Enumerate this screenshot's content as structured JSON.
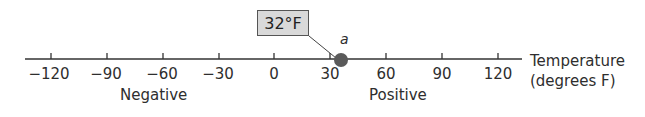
{
  "diagram": {
    "type": "number-line",
    "axis_label_line1": "Temperature",
    "axis_label_line2": "(degrees F)",
    "ticks": [
      "−120",
      "−90",
      "−60",
      "−30",
      "0",
      "30",
      "60",
      "90",
      "120"
    ],
    "region_labels": {
      "negative": "Negative",
      "positive": "Positive"
    },
    "point": {
      "label": "a",
      "value": 32
    },
    "callout_text": "32°F",
    "colors": {
      "axis": "#333333",
      "point": "#5a5a5a",
      "callout_bg": "#d9d9d9"
    }
  }
}
